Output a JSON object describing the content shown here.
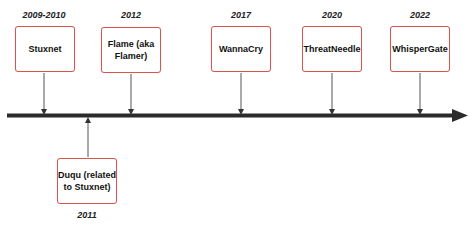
{
  "diagram": {
    "type": "timeline",
    "colors": {
      "box_border": "#d9534f",
      "axis": "#2b2b2b",
      "connector": "#555555"
    },
    "events_above": [
      {
        "year": "2009-2010",
        "label": "Stuxnet"
      },
      {
        "year": "2012",
        "label": "Flame (aka Flamer)"
      },
      {
        "year": "2017",
        "label": "WannaCry"
      },
      {
        "year": "2020",
        "label": "ThreatNeedle"
      },
      {
        "year": "2022",
        "label": "WhisperGate"
      }
    ],
    "events_below": [
      {
        "year": "2011",
        "label": "Duqu (related to Stuxnet)"
      }
    ]
  }
}
